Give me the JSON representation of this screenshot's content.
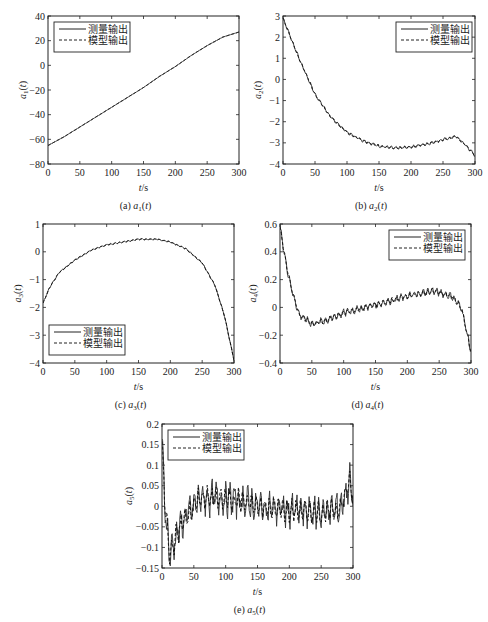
{
  "chart_data": [
    {
      "id": "a",
      "type": "line",
      "caption": "(a)  a1(t)",
      "caption_prefix": "(a)",
      "caption_var": "a",
      "caption_sub": "1",
      "xlabel": "t/s",
      "ylabel": "a1(t)",
      "ylabel_sub": "1",
      "xlim": [
        0,
        300
      ],
      "ylim": [
        -80,
        40
      ],
      "xticks": [
        0,
        50,
        100,
        150,
        200,
        250,
        300
      ],
      "yticks": [
        -80,
        -60,
        -40,
        -20,
        0,
        20,
        40
      ],
      "ytick_labels": [
        "−80",
        "−60",
        "−40",
        "−20",
        "0",
        "20",
        "40"
      ],
      "legend_position": "upper left",
      "legend": [
        "测量输出",
        "模型输出"
      ],
      "x": [
        0,
        25,
        50,
        75,
        100,
        125,
        150,
        175,
        200,
        225,
        250,
        275,
        300
      ],
      "series": [
        {
          "name": "测量输出",
          "style": "solid",
          "values": [
            -65,
            -58,
            -50,
            -42,
            -34,
            -26,
            -18,
            -9,
            -1,
            8,
            16,
            23,
            27
          ]
        },
        {
          "name": "模型输出",
          "style": "dashed",
          "values": [
            -65,
            -58,
            -50,
            -42,
            -34,
            -26,
            -18,
            -9,
            -1,
            8,
            16,
            23,
            27
          ]
        }
      ],
      "noise": 0
    },
    {
      "id": "b",
      "type": "line",
      "caption": "(b)  a2(t)",
      "caption_prefix": "(b)",
      "caption_var": "a",
      "caption_sub": "2",
      "xlabel": "t/s",
      "ylabel": "a2(t)",
      "ylabel_sub": "2",
      "xlim": [
        0,
        300
      ],
      "ylim": [
        -4,
        3
      ],
      "xticks": [
        0,
        50,
        100,
        150,
        200,
        250,
        300
      ],
      "yticks": [
        -4,
        -3,
        -2,
        -1,
        0,
        1,
        2,
        3
      ],
      "ytick_labels": [
        "−4",
        "−3",
        "−2",
        "−1",
        "0",
        "1",
        "2",
        "3"
      ],
      "legend_position": "upper right",
      "legend": [
        "测量输出",
        "模型输出"
      ],
      "x": [
        0,
        25,
        50,
        75,
        100,
        125,
        150,
        175,
        200,
        225,
        250,
        270,
        285,
        300
      ],
      "series": [
        {
          "name": "测量输出",
          "style": "solid",
          "values": [
            2.9,
            1.0,
            -0.7,
            -1.8,
            -2.5,
            -2.9,
            -3.15,
            -3.25,
            -3.2,
            -3.05,
            -2.85,
            -2.7,
            -3.1,
            -3.6
          ]
        },
        {
          "name": "模型输出",
          "style": "dashed",
          "values": [
            2.9,
            1.0,
            -0.7,
            -1.8,
            -2.5,
            -2.9,
            -3.15,
            -3.25,
            -3.2,
            -3.05,
            -2.85,
            -2.7,
            -3.1,
            -3.6
          ]
        }
      ],
      "noise": 0.08
    },
    {
      "id": "c",
      "type": "line",
      "caption": "(c)  a3(t)",
      "caption_prefix": "(c)",
      "caption_var": "a",
      "caption_sub": "3",
      "xlabel": "t/s",
      "ylabel": "a3(t)",
      "ylabel_sub": "3",
      "xlim": [
        0,
        300
      ],
      "ylim": [
        -4,
        1
      ],
      "xticks": [
        0,
        50,
        100,
        150,
        200,
        250,
        300
      ],
      "yticks": [
        -4,
        -3,
        -2,
        -1,
        0,
        1
      ],
      "ytick_labels": [
        "−4",
        "−3",
        "−2",
        "−1",
        "0",
        "1"
      ],
      "legend_position": "lower left",
      "legend": [
        "测量输出",
        "模型输出"
      ],
      "x": [
        0,
        10,
        25,
        50,
        75,
        100,
        150,
        180,
        200,
        225,
        250,
        270,
        285,
        300
      ],
      "series": [
        {
          "name": "测量输出",
          "style": "solid",
          "values": [
            -1.85,
            -1.3,
            -0.75,
            -0.3,
            0.05,
            0.25,
            0.45,
            0.45,
            0.35,
            0.1,
            -0.4,
            -1.2,
            -2.3,
            -3.9
          ]
        },
        {
          "name": "模型输出",
          "style": "dashed",
          "values": [
            -1.85,
            -1.3,
            -0.75,
            -0.3,
            0.05,
            0.25,
            0.45,
            0.45,
            0.35,
            0.1,
            -0.4,
            -1.2,
            -2.3,
            -3.9
          ]
        }
      ],
      "noise": 0.03
    },
    {
      "id": "d",
      "type": "line",
      "caption": "(d)  a4(t)",
      "caption_prefix": "(d)",
      "caption_var": "a",
      "caption_sub": "4",
      "xlabel": "t/s",
      "ylabel": "a4(t)",
      "ylabel_sub": "4",
      "xlim": [
        0,
        300
      ],
      "ylim": [
        -0.4,
        0.6
      ],
      "xticks": [
        0,
        50,
        100,
        150,
        200,
        250,
        300
      ],
      "yticks": [
        -0.4,
        -0.2,
        0,
        0.2,
        0.4,
        0.6
      ],
      "ytick_labels": [
        "−0.4",
        "−0.2",
        "0",
        "0.2",
        "0.4",
        "0.6"
      ],
      "legend_position": "upper right",
      "legend": [
        "测量输出",
        "模型输出"
      ],
      "x": [
        0,
        10,
        20,
        30,
        50,
        75,
        100,
        150,
        200,
        240,
        270,
        285,
        300
      ],
      "series": [
        {
          "name": "测量输出",
          "style": "solid",
          "values": [
            0.58,
            0.3,
            0.1,
            -0.05,
            -0.12,
            -0.09,
            -0.04,
            0.02,
            0.08,
            0.12,
            0.08,
            0.0,
            -0.32
          ]
        },
        {
          "name": "模型输出",
          "style": "dashed",
          "values": [
            0.58,
            0.3,
            0.1,
            -0.05,
            -0.12,
            -0.09,
            -0.04,
            0.02,
            0.08,
            0.12,
            0.08,
            0.0,
            -0.32
          ]
        }
      ],
      "noise": 0.03
    },
    {
      "id": "e",
      "type": "line",
      "caption": "(e)  a5(t)",
      "caption_prefix": "(e)",
      "caption_var": "a",
      "caption_sub": "5",
      "xlabel": "t/s",
      "ylabel": "a5(t)",
      "ylabel_sub": "5",
      "xlim": [
        0,
        300
      ],
      "ylim": [
        -0.15,
        0.2
      ],
      "xticks": [
        0,
        50,
        100,
        150,
        200,
        250,
        300
      ],
      "yticks": [
        -0.15,
        -0.1,
        -0.05,
        0,
        0.05,
        0.1,
        0.15,
        0.2
      ],
      "ytick_labels": [
        "−0.15",
        "−0.1",
        "−0.05",
        "0",
        "0.05",
        "0.1",
        "0.15",
        "0.2"
      ],
      "legend_position": "upper left",
      "legend": [
        "测量输出",
        "模型输出"
      ],
      "x": [
        0,
        5,
        12,
        25,
        40,
        60,
        90,
        120,
        150,
        200,
        250,
        280,
        295,
        300
      ],
      "series": [
        {
          "name": "测量输出",
          "style": "solid",
          "values": [
            0.15,
            0.0,
            -0.12,
            -0.06,
            -0.02,
            0.02,
            0.02,
            0.015,
            0.0,
            -0.01,
            -0.015,
            -0.005,
            0.06,
            0.02
          ]
        },
        {
          "name": "模型输出",
          "style": "dashed",
          "values": [
            0.15,
            0.0,
            -0.12,
            -0.06,
            -0.02,
            0.02,
            0.02,
            0.015,
            0.0,
            -0.01,
            -0.015,
            -0.005,
            0.06,
            0.02
          ]
        }
      ],
      "noise": 0.045
    }
  ]
}
